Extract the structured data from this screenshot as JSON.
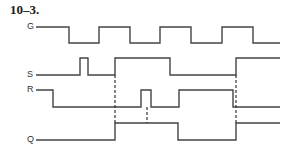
{
  "figure": {
    "title": "10–3.",
    "signals": [
      {
        "name": "G",
        "label_x": 27,
        "label_y": 22,
        "high_y": 27,
        "low_y": 43,
        "start_level": 1,
        "start_x": 40,
        "end_x": 280,
        "transitions": [
          69,
          99,
          130,
          160,
          191,
          222,
          253
        ]
      },
      {
        "name": "S",
        "label_x": 27,
        "label_y": 70,
        "high_y": 58,
        "low_y": 75,
        "start_level": 0,
        "start_x": 40,
        "end_x": 280,
        "transitions": [
          80,
          88,
          115,
          170,
          236
        ]
      },
      {
        "name": "R",
        "label_x": 27,
        "label_y": 85,
        "high_y": 90,
        "low_y": 107,
        "start_level": 1,
        "start_x": 40,
        "end_x": 280,
        "transitions": [
          53,
          141,
          151,
          179,
          233
        ]
      },
      {
        "name": "Q",
        "label_x": 27,
        "label_y": 135,
        "high_y": 123,
        "low_y": 140,
        "start_level": 0,
        "start_x": 40,
        "end_x": 280,
        "transitions": [
          115,
          178,
          236
        ]
      }
    ],
    "dashed_markers": [
      {
        "x": 115,
        "y1": 75,
        "y2": 123
      },
      {
        "x": 147,
        "y1": 107,
        "y2": 123
      },
      {
        "x": 236,
        "y1": 75,
        "y2": 123
      }
    ]
  }
}
